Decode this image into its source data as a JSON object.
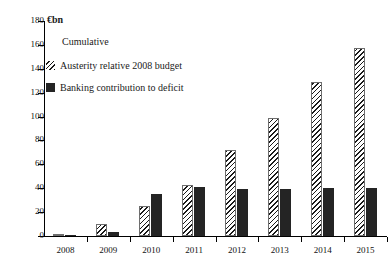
{
  "unit_label": "€bn",
  "cumulative_label": "Cumulative",
  "legend": {
    "items": [
      {
        "key": "austerity",
        "label": "Austerity relative 2008 budget",
        "swatch": "hatched-diagonal",
        "color": "#1a1a1a"
      },
      {
        "key": "banking",
        "label": "Banking contribution to deficit",
        "swatch": "solid-square",
        "color": "#242424"
      }
    ]
  },
  "axis": {
    "y_ticks": [
      "0",
      "20",
      "40",
      "60",
      "80",
      "100",
      "120",
      "140",
      "160",
      "180"
    ],
    "x_ticks": [
      "2008",
      "2009",
      "2010",
      "2011",
      "2012",
      "2013",
      "2014",
      "2015"
    ]
  },
  "chart_data": {
    "type": "bar",
    "title": "",
    "subtitle": "Cumulative",
    "xlabel": "",
    "ylabel": "€bn",
    "ylim": [
      0,
      180
    ],
    "ytick_step": 20,
    "grid": false,
    "legend_position": "top-left",
    "categories": [
      "2008",
      "2009",
      "2010",
      "2011",
      "2012",
      "2013",
      "2014",
      "2015"
    ],
    "series": [
      {
        "name": "Austerity relative 2008 budget",
        "style": "hatched",
        "values": [
          1,
          10,
          25,
          43,
          72,
          99,
          129,
          157
        ]
      },
      {
        "name": "Banking contribution to deficit",
        "style": "solid",
        "values": [
          0.5,
          3,
          35,
          41,
          39,
          39,
          40,
          40
        ]
      }
    ]
  }
}
